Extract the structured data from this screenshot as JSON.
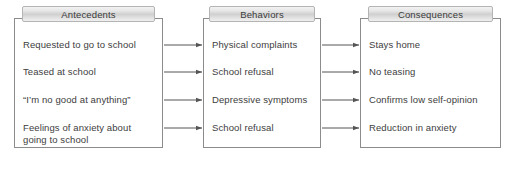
{
  "diagram": {
    "type": "functional-assessment-abc-chart",
    "columns": [
      {
        "id": "antecedents",
        "header": "Antecedents",
        "rows": [
          {
            "lines": [
              "Requested to go to school"
            ]
          },
          {
            "lines": [
              "Teased at school"
            ]
          },
          {
            "lines": [
              "“I’m no good at anything”"
            ]
          },
          {
            "lines": [
              "Feelings of anxiety about",
              "going to school"
            ]
          }
        ]
      },
      {
        "id": "behaviors",
        "header": "Behaviors",
        "rows": [
          {
            "lines": [
              "Physical complaints"
            ]
          },
          {
            "lines": [
              "School refusal"
            ]
          },
          {
            "lines": [
              "Depressive symptoms"
            ]
          },
          {
            "lines": [
              "School refusal"
            ]
          }
        ]
      },
      {
        "id": "consequences",
        "header": "Consequences",
        "rows": [
          {
            "lines": [
              "Stays home"
            ]
          },
          {
            "lines": [
              "No teasing"
            ]
          },
          {
            "lines": [
              "Confirms low self-opinion"
            ]
          },
          {
            "lines": [
              "Reduction in anxiety"
            ]
          }
        ]
      }
    ],
    "connectors": {
      "style": "single-headed-arrow",
      "count": 8,
      "description": "Each antecedent row points to the behavior row in the same position, and each behavior row points to the consequence row in the same position."
    },
    "colors": {
      "box_border": "#8c8c8c",
      "header_border": "#b4b4b4",
      "header_fill_light": "#f2f2f2",
      "header_fill_mid": "#cfcfcf",
      "text": "#3d3d3d",
      "arrow": "#555555",
      "background": "#ffffff"
    }
  }
}
